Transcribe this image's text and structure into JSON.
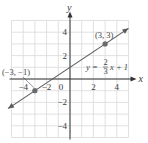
{
  "chart_data": {
    "type": "line",
    "title": "",
    "xlabel": "x",
    "ylabel": "y",
    "xlim": [
      -5,
      5
    ],
    "ylim": [
      -5,
      5
    ],
    "grid": true,
    "x_ticks": [
      -4,
      -2,
      0,
      2,
      4
    ],
    "y_ticks": [
      4,
      2,
      -2,
      -4
    ],
    "x_tick_labels": [
      "−4",
      "−2",
      "0",
      "2",
      "4"
    ],
    "y_tick_labels": [
      "4",
      "2",
      "−2",
      "−4"
    ],
    "origin_label": "0",
    "series": [
      {
        "name": "y = (2/3)x + 1",
        "slope": 0.6667,
        "intercept": 1,
        "x": [
          -5.3,
          5
        ],
        "y": [
          -2.53,
          4.33
        ],
        "arrows": "both",
        "color": "#5a5a5a"
      }
    ],
    "points": [
      {
        "x": -3,
        "y": -1,
        "label": "(−3, −1)"
      },
      {
        "x": 3,
        "y": 3,
        "label": "(3, 3)"
      }
    ],
    "equation_label": {
      "prefix": "y =",
      "numerator": "2",
      "denominator": "3",
      "suffix": "x + 1"
    },
    "colors": {
      "grid": "#d9d9d9",
      "axis": "#333333",
      "line": "#5a5a5a",
      "point": "#6b6b6b"
    }
  }
}
